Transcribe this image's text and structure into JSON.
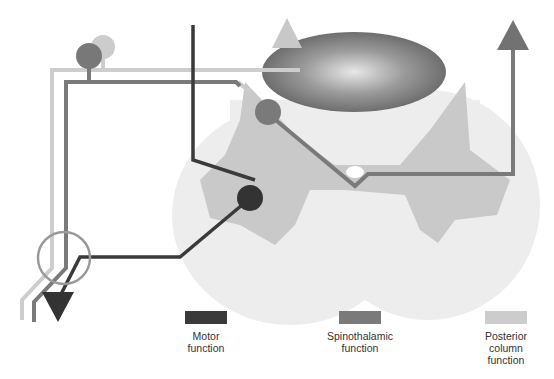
{
  "diagram": {
    "structures": {
      "cord_outline": "spinal-cord-cross-section",
      "grey_matter": "grey-matter-butterfly",
      "posterior_columns": "posterior-column-ellipse",
      "central_canal": "central-canal"
    },
    "colors": {
      "motor": "#3a3a3a",
      "spinothalamic": "#7a7a7a",
      "posterior_column": "#c8c8c8",
      "cord_bg": "#ececec",
      "grey_matter": "#c9c9c9"
    }
  },
  "legend": {
    "items": [
      {
        "key": "motor",
        "label": "Motor\nfunction",
        "color": "#3a3a3a"
      },
      {
        "key": "spinothalamic",
        "label": "Spinothalamic\nfunction",
        "color": "#7a7a7a"
      },
      {
        "key": "posterior_column",
        "label": "Posterior\ncolumn\nfunction",
        "color": "#cccccc"
      }
    ]
  }
}
